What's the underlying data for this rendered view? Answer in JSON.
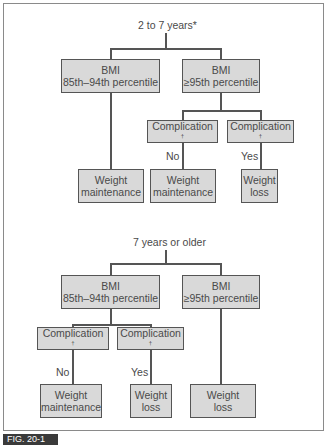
{
  "figure_label": "FIG. 20-1",
  "colors": {
    "box_fill": "#d9d9d9",
    "box_border": "#555555",
    "text": "#4a4a4a",
    "fig_label_bg": "#3a3a3a"
  },
  "diagram_a": {
    "root": "2 to 7 years*",
    "left": {
      "line1": "BMI",
      "line2": "85th–94th percentile"
    },
    "right": {
      "line1": "BMI",
      "line2": "≥95th percentile"
    },
    "complication_no": "Complication",
    "complication_yes": "Complication",
    "dagger": "†",
    "edge_no": "No",
    "edge_yes": "Yes",
    "out_left": {
      "line1": "Weight",
      "line2": "maintenance"
    },
    "out_mid": {
      "line1": "Weight",
      "line2": "maintenance"
    },
    "out_right": {
      "line1": "Weight",
      "line2": "loss"
    }
  },
  "diagram_b": {
    "root": "7 years or older",
    "left": {
      "line1": "BMI",
      "line2": "85th–94th percentile"
    },
    "right": {
      "line1": "BMI",
      "line2": "≥95th percentile"
    },
    "complication_no": "Complication",
    "complication_yes": "Complication",
    "dagger": "†",
    "edge_no": "No",
    "edge_yes": "Yes",
    "out_left": {
      "line1": "Weight",
      "line2": "maintenance"
    },
    "out_mid": {
      "line1": "Weight",
      "line2": "loss"
    },
    "out_right": {
      "line1": "Weight",
      "line2": "loss"
    }
  }
}
